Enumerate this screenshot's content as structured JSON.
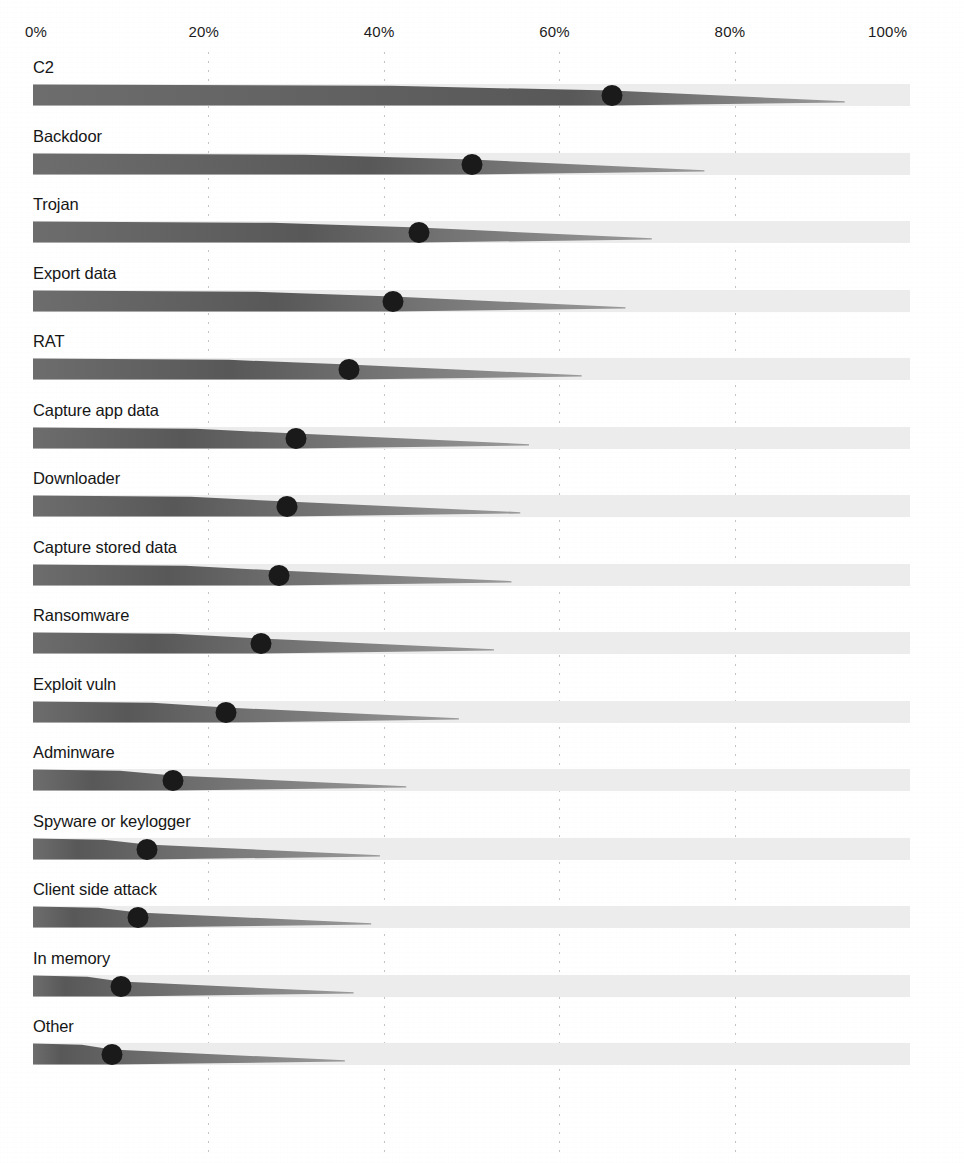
{
  "chart_data": {
    "type": "bar",
    "title": "",
    "subtitle": "",
    "xlabel": "",
    "ylabel": "",
    "xlim": [
      0,
      100
    ],
    "ylim": null,
    "grid": true,
    "legend": null,
    "orientation": "horizontal",
    "value_unit": "%",
    "axis": {
      "ticks": [
        0,
        20,
        40,
        60,
        80,
        100
      ],
      "tick_labels": [
        "0%",
        "20%",
        "40%",
        "60%",
        "80%",
        "100%"
      ],
      "position": "top"
    },
    "categories": [
      "C2",
      "Backdoor",
      "Trojan",
      "Export data",
      "RAT",
      "Capture app data",
      "Downloader",
      "Capture stored data",
      "Ransomware",
      "Exploit vuln",
      "Adminware",
      "Spyware or keylogger",
      "Client side attack",
      "In memory",
      "Other"
    ],
    "values": [
      66,
      50,
      44,
      41,
      36,
      30,
      29,
      28,
      26,
      22,
      16,
      13,
      12,
      10,
      9
    ],
    "series": [
      {
        "name": "Percent of breaches",
        "values": [
          66,
          50,
          44,
          41,
          36,
          30,
          29,
          28,
          26,
          22,
          16,
          13,
          12,
          10,
          9
        ]
      }
    ],
    "colors": {
      "bar": "#6d6d6d",
      "track": "#ececec",
      "marker": "#1a1a1a",
      "gridline": "#b9b9b9",
      "text": "#161616",
      "background": "#ffffff"
    }
  },
  "layout": {
    "plot_left_px": 33,
    "plot_right_px": 910,
    "row_pitch_px": 68.5,
    "first_row_top_px": 58,
    "bar_height_px": 22,
    "marker_diameter_px": 21
  }
}
